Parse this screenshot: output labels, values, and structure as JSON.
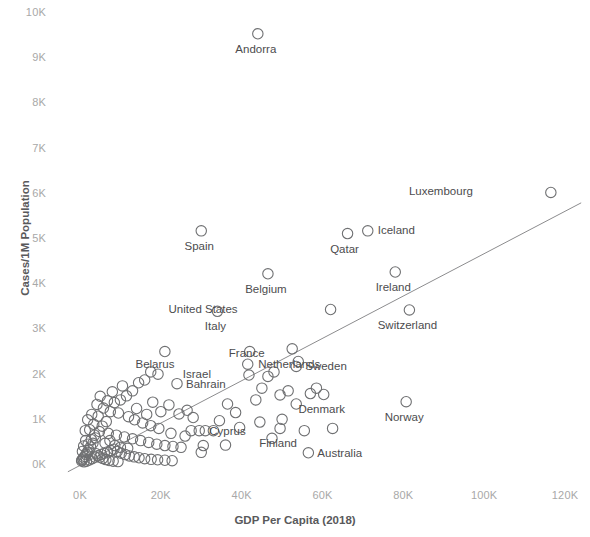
{
  "chart_data": {
    "type": "scatter",
    "title": "",
    "xlabel": "GDP Per Capita (2018)",
    "ylabel": "Cases/1M Population",
    "xlim": [
      -4000,
      126000
    ],
    "ylim": [
      -250,
      10250
    ],
    "xticks": [
      0,
      20000,
      40000,
      60000,
      80000,
      100000,
      120000
    ],
    "xticklabels": [
      "0K",
      "20K",
      "40K",
      "60K",
      "80K",
      "100K",
      "120K"
    ],
    "yticks": [
      0,
      1000,
      2000,
      3000,
      4000,
      5000,
      6000,
      7000,
      8000,
      9000,
      10000
    ],
    "yticklabels": [
      "0K",
      "1K",
      "2K",
      "3K",
      "4K",
      "5K",
      "6K",
      "7K",
      "8K",
      "9K",
      "10K"
    ],
    "grid": false,
    "legend": null,
    "marker": "open-circle",
    "marker_color": "#6f7072",
    "trendline": {
      "show": true,
      "color": "#8c8c8e",
      "x0": -3000,
      "y0": -150,
      "x1": 124000,
      "y1": 5800
    },
    "labeled_points": [
      {
        "name": "Andorra",
        "x": 44000,
        "y": 9540,
        "label_dx": -2,
        "label_dy": 16
      },
      {
        "name": "Luxembourg",
        "x": 116500,
        "y": 6030,
        "label_dx": -78,
        "label_dy": 0,
        "label_align": "right"
      },
      {
        "name": "Iceland",
        "x": 71200,
        "y": 5180,
        "label_dx": 10,
        "label_dy": 0,
        "label_align": "left"
      },
      {
        "name": "Qatar",
        "x": 66200,
        "y": 5120,
        "label_dx": -3,
        "label_dy": 16
      },
      {
        "name": "Spain",
        "x": 30000,
        "y": 5180,
        "label_dx": -2,
        "label_dy": 16
      },
      {
        "name": "Ireland",
        "x": 78000,
        "y": 4270,
        "label_dx": -2,
        "label_dy": 16
      },
      {
        "name": "Belgium",
        "x": 46500,
        "y": 4230,
        "label_dx": -2,
        "label_dy": 16
      },
      {
        "name": "United States",
        "x": 62000,
        "y": 3440,
        "label_dx": -93,
        "label_dy": 0,
        "label_align": "right"
      },
      {
        "name": "Switzerland",
        "x": 81500,
        "y": 3430,
        "label_dx": -2,
        "label_dy": 16
      },
      {
        "name": "Italy",
        "x": 34000,
        "y": 3400,
        "label_dx": -2,
        "label_dy": 16
      },
      {
        "name": "Netherlands",
        "x": 52500,
        "y": 2570,
        "label_dx": -3,
        "label_dy": 16
      },
      {
        "name": "France",
        "x": 41500,
        "y": 2230,
        "label_dx": -1,
        "label_dy": -10
      },
      {
        "name": "Sweden",
        "x": 53500,
        "y": 2180,
        "label_dx": 9,
        "label_dy": 1,
        "label_align": "left"
      },
      {
        "name": "Israel",
        "x": 41800,
        "y": 1990,
        "label_dx": -38,
        "label_dy": 0,
        "label_align": "right"
      },
      {
        "name": "Belarus",
        "x": 19300,
        "y": 2010,
        "label_dx": -3,
        "label_dy": -9
      },
      {
        "name": "Bahrain",
        "x": 24000,
        "y": 1800,
        "label_dx": 9,
        "label_dy": 1,
        "label_align": "left"
      },
      {
        "name": "Denmark",
        "x": 60300,
        "y": 1560,
        "label_dx": -2,
        "label_dy": 16
      },
      {
        "name": "Norway",
        "x": 80700,
        "y": 1400,
        "label_dx": -2,
        "label_dy": 16
      },
      {
        "name": "Cyprus",
        "x": 29500,
        "y": 760,
        "label_dx": 10,
        "label_dy": 1,
        "label_align": "left"
      },
      {
        "name": "Finland",
        "x": 49500,
        "y": 810,
        "label_dx": -2,
        "label_dy": 16
      },
      {
        "name": "Australia",
        "x": 56500,
        "y": 270,
        "label_dx": 9,
        "label_dy": 1,
        "label_align": "left"
      }
    ],
    "unlabeled_points": [
      {
        "x": 42000,
        "y": 2510
      },
      {
        "x": 46500,
        "y": 1960
      },
      {
        "x": 48000,
        "y": 2060
      },
      {
        "x": 45000,
        "y": 1700
      },
      {
        "x": 43500,
        "y": 1440
      },
      {
        "x": 49500,
        "y": 1550
      },
      {
        "x": 51500,
        "y": 1640
      },
      {
        "x": 53500,
        "y": 1350
      },
      {
        "x": 57000,
        "y": 1580
      },
      {
        "x": 58500,
        "y": 1700
      },
      {
        "x": 36500,
        "y": 1350
      },
      {
        "x": 38500,
        "y": 1160
      },
      {
        "x": 34500,
        "y": 980
      },
      {
        "x": 31000,
        "y": 760
      },
      {
        "x": 33000,
        "y": 760
      },
      {
        "x": 27500,
        "y": 760
      },
      {
        "x": 28000,
        "y": 1050
      },
      {
        "x": 24500,
        "y": 1130
      },
      {
        "x": 26500,
        "y": 1210
      },
      {
        "x": 21000,
        "y": 2510
      },
      {
        "x": 17500,
        "y": 2060
      },
      {
        "x": 16000,
        "y": 1880
      },
      {
        "x": 14500,
        "y": 1820
      },
      {
        "x": 13000,
        "y": 1640
      },
      {
        "x": 11500,
        "y": 1530
      },
      {
        "x": 10000,
        "y": 1440
      },
      {
        "x": 8500,
        "y": 1380
      },
      {
        "x": 7500,
        "y": 1180
      },
      {
        "x": 9500,
        "y": 1150
      },
      {
        "x": 12000,
        "y": 1070
      },
      {
        "x": 13500,
        "y": 1000
      },
      {
        "x": 15500,
        "y": 930
      },
      {
        "x": 17500,
        "y": 870
      },
      {
        "x": 19500,
        "y": 810
      },
      {
        "x": 6500,
        "y": 960
      },
      {
        "x": 5500,
        "y": 860
      },
      {
        "x": 4800,
        "y": 740
      },
      {
        "x": 7000,
        "y": 700
      },
      {
        "x": 9000,
        "y": 660
      },
      {
        "x": 11000,
        "y": 620
      },
      {
        "x": 13000,
        "y": 580
      },
      {
        "x": 15000,
        "y": 540
      },
      {
        "x": 17000,
        "y": 500
      },
      {
        "x": 19000,
        "y": 460
      },
      {
        "x": 21000,
        "y": 430
      },
      {
        "x": 23000,
        "y": 410
      },
      {
        "x": 25000,
        "y": 390
      },
      {
        "x": 3800,
        "y": 600
      },
      {
        "x": 3200,
        "y": 480
      },
      {
        "x": 2600,
        "y": 400
      },
      {
        "x": 2200,
        "y": 330
      },
      {
        "x": 1800,
        "y": 280
      },
      {
        "x": 1500,
        "y": 230
      },
      {
        "x": 1200,
        "y": 190
      },
      {
        "x": 900,
        "y": 160
      },
      {
        "x": 700,
        "y": 130
      },
      {
        "x": 500,
        "y": 110
      },
      {
        "x": 400,
        "y": 90
      },
      {
        "x": 1000,
        "y": 70
      },
      {
        "x": 1600,
        "y": 85
      },
      {
        "x": 2300,
        "y": 110
      },
      {
        "x": 3000,
        "y": 140
      },
      {
        "x": 3700,
        "y": 175
      },
      {
        "x": 4400,
        "y": 205
      },
      {
        "x": 5200,
        "y": 235
      },
      {
        "x": 6000,
        "y": 260
      },
      {
        "x": 6800,
        "y": 290
      },
      {
        "x": 7600,
        "y": 320
      },
      {
        "x": 8400,
        "y": 350
      },
      {
        "x": 9200,
        "y": 300
      },
      {
        "x": 10200,
        "y": 260
      },
      {
        "x": 11200,
        "y": 230
      },
      {
        "x": 12200,
        "y": 200
      },
      {
        "x": 13400,
        "y": 180
      },
      {
        "x": 14600,
        "y": 160
      },
      {
        "x": 16000,
        "y": 140
      },
      {
        "x": 17600,
        "y": 125
      },
      {
        "x": 19200,
        "y": 115
      },
      {
        "x": 21000,
        "y": 105
      },
      {
        "x": 22800,
        "y": 95
      },
      {
        "x": 2000,
        "y": 460
      },
      {
        "x": 2800,
        "y": 560
      },
      {
        "x": 3600,
        "y": 660
      },
      {
        "x": 4500,
        "y": 1080
      },
      {
        "x": 5800,
        "y": 1260
      },
      {
        "x": 6800,
        "y": 1420
      },
      {
        "x": 5000,
        "y": 1520
      },
      {
        "x": 4200,
        "y": 1340
      },
      {
        "x": 8000,
        "y": 1620
      },
      {
        "x": 10500,
        "y": 1750
      },
      {
        "x": 6200,
        "y": 480
      },
      {
        "x": 7400,
        "y": 540
      },
      {
        "x": 8600,
        "y": 430
      },
      {
        "x": 10000,
        "y": 390
      },
      {
        "x": 11800,
        "y": 370
      },
      {
        "x": 4000,
        "y": 250
      },
      {
        "x": 4900,
        "y": 175
      },
      {
        "x": 5600,
        "y": 145
      },
      {
        "x": 6400,
        "y": 120
      },
      {
        "x": 7200,
        "y": 100
      },
      {
        "x": 8200,
        "y": 85
      },
      {
        "x": 9400,
        "y": 75
      },
      {
        "x": 1400,
        "y": 540
      },
      {
        "x": 900,
        "y": 420
      },
      {
        "x": 600,
        "y": 300
      },
      {
        "x": 36000,
        "y": 440
      },
      {
        "x": 30500,
        "y": 430
      },
      {
        "x": 50000,
        "y": 1010
      },
      {
        "x": 44500,
        "y": 950
      },
      {
        "x": 55500,
        "y": 760
      },
      {
        "x": 62500,
        "y": 810
      },
      {
        "x": 39500,
        "y": 830
      },
      {
        "x": 47500,
        "y": 590
      },
      {
        "x": 30000,
        "y": 280
      },
      {
        "x": 26000,
        "y": 640
      },
      {
        "x": 22500,
        "y": 700
      },
      {
        "x": 20000,
        "y": 1180
      },
      {
        "x": 22000,
        "y": 1330
      },
      {
        "x": 18000,
        "y": 1390
      },
      {
        "x": 54000,
        "y": 2290
      },
      {
        "x": 2400,
        "y": 780
      },
      {
        "x": 3400,
        "y": 900
      },
      {
        "x": 1900,
        "y": 1000
      },
      {
        "x": 2900,
        "y": 1120
      },
      {
        "x": 1300,
        "y": 760
      },
      {
        "x": 14000,
        "y": 1250
      },
      {
        "x": 16500,
        "y": 1120
      }
    ]
  },
  "axis": {
    "y_title": "Cases/1M Population",
    "x_title": "GDP Per Capita (2018)"
  }
}
